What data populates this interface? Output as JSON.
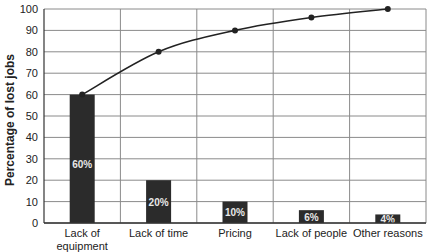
{
  "chart_data": {
    "type": "bar",
    "title": "",
    "xlabel": "",
    "ylabel": "Percentage of lost jobs",
    "ylim": [
      0,
      100
    ],
    "yticks": [
      0,
      10,
      20,
      30,
      40,
      50,
      60,
      70,
      80,
      90,
      100
    ],
    "grid": true,
    "legend": null,
    "categories": [
      [
        "Lack of",
        "equipment"
      ],
      [
        "Lack of time"
      ],
      [
        "Pricing"
      ],
      [
        "Lack of people"
      ],
      [
        "Other reasons"
      ]
    ],
    "series": [
      {
        "name": "Percentage",
        "type": "bar",
        "values": [
          60,
          20,
          10,
          6,
          4
        ],
        "labels": [
          "60%",
          "20%",
          "10%",
          "6%",
          "4%"
        ],
        "color": "#2b2b2b"
      },
      {
        "name": "Cumulative percentage",
        "type": "line",
        "values": [
          60,
          80,
          90,
          96,
          100
        ],
        "color": "#222222",
        "markers": true
      }
    ]
  },
  "colors": {
    "bar": "#2b2b2b",
    "bar_label": "#e8e8e8",
    "grid": "#8a8a8a",
    "axis": "#333333",
    "line": "#222222"
  }
}
